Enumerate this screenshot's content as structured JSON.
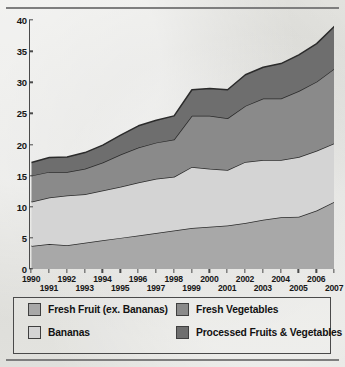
{
  "chart_data": {
    "type": "area",
    "stacked": true,
    "title": "",
    "subtitle": "",
    "xlabel": "",
    "ylabel": "",
    "x": [
      1990,
      1991,
      1992,
      1993,
      1994,
      1995,
      1996,
      1997,
      1998,
      1999,
      2000,
      2001,
      2002,
      2003,
      2004,
      2005,
      2006,
      2007
    ],
    "xlim": [
      1990,
      2007
    ],
    "ylim": [
      0,
      40
    ],
    "yticks": [
      0,
      5,
      10,
      15,
      20,
      25,
      30,
      35,
      40
    ],
    "xticks": [
      "1990",
      "1991",
      "1992",
      "1993",
      "1994",
      "1995",
      "1996",
      "1997",
      "1998",
      "1999",
      "2000",
      "2001",
      "2002",
      "2003",
      "2004",
      "2005",
      "2006",
      "2007"
    ],
    "grid": false,
    "legend_position": "bottom",
    "series": [
      {
        "name": "Fresh Fruit (ex. Bananas)",
        "color": "#a8a8a8",
        "values": [
          3.7,
          4.0,
          3.8,
          4.2,
          4.6,
          5.0,
          5.4,
          5.8,
          6.2,
          6.6,
          6.8,
          7.0,
          7.4,
          7.9,
          8.3,
          8.4,
          9.4,
          10.8
        ]
      },
      {
        "name": "Bananas",
        "color": "#d4d4d4",
        "values": [
          7.1,
          7.5,
          8.0,
          7.8,
          8.0,
          8.2,
          8.5,
          8.7,
          8.6,
          9.8,
          9.3,
          8.9,
          9.8,
          9.6,
          9.2,
          9.6,
          9.6,
          9.4
        ]
      },
      {
        "name": "Fresh Vegetables",
        "color": "#8a8a8a",
        "values": [
          4.2,
          4.1,
          3.8,
          4.1,
          4.5,
          5.2,
          5.6,
          5.8,
          6.0,
          8.2,
          8.5,
          8.3,
          9.0,
          9.9,
          9.9,
          10.6,
          11.1,
          12.0
        ]
      },
      {
        "name": "Processed Fruits & Vegetables",
        "color": "#6e6e6e",
        "values": [
          2.1,
          2.3,
          2.4,
          2.6,
          2.8,
          3.1,
          3.5,
          3.6,
          3.8,
          4.2,
          4.4,
          4.6,
          5.0,
          5.0,
          5.6,
          5.8,
          6.1,
          6.8
        ]
      }
    ],
    "totals": [
      17.1,
      17.9,
      18.0,
      18.7,
      19.9,
      21.5,
      23.0,
      23.9,
      24.6,
      28.8,
      29.0,
      28.8,
      31.2,
      32.4,
      33.0,
      34.4,
      36.2,
      39.0
    ]
  },
  "legend": {
    "items": [
      {
        "label": "Fresh Fruit (ex. Bananas)",
        "color": "#a8a8a8"
      },
      {
        "label": "Bananas",
        "color": "#d4d4d4"
      },
      {
        "label": "Fresh Vegetables",
        "color": "#8a8a8a"
      },
      {
        "label": "Processed Fruits & Vegetables",
        "color": "#6e6e6e"
      }
    ]
  }
}
